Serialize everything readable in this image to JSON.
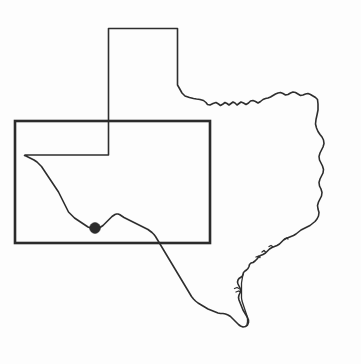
{
  "figure": {
    "type": "reference-map",
    "width": 361,
    "height": 364,
    "background_color": "#fdfdfd",
    "visible_text": []
  },
  "layers": {
    "state_outline": {
      "name": "texas-state-outline",
      "stroke_color": "#2e2e2e",
      "stroke_width": 1.6,
      "fill": "none"
    },
    "coast_inner": {
      "name": "gulf-coast-barrier-island-line",
      "stroke_color": "#2e2e2e",
      "stroke_width": 1.3,
      "fill": "none"
    },
    "study_area_box": {
      "name": "study-area-rectangle",
      "stroke_color": "#2b2b2b",
      "stroke_width": 2.6,
      "fill": "none",
      "x": 15,
      "y": 121,
      "width": 195,
      "height": 122
    },
    "site_marker": {
      "name": "site-location-dot",
      "fill_color": "#2b2b2b",
      "cx": 95,
      "cy": 228,
      "r": 5.4
    }
  },
  "geometry": {
    "state_path": "M108.5,28.5 L177.5,28.5 L177.5,85 L179.5,88.5 L182,93 L185,96 L189.5,97.5 L193.5,98.5 L196.5,99 L200,99.5 L203.5,100.5 L206,102.5 L207.5,104.5 L210,105 L213,103.5 L216,102.5 L218.5,104 L220.5,105.5 L223,104 L225,102.5 L227,103.5 L229,105 L231,103.5 L233,102 L235,103 L237,105 L239,103.5 L241,102 L243.5,103 L246,104.5 L248.5,103 L250.5,101 L253,100.5 L255.5,101.5 L258,103 L260.5,101.5 L263,99.5 L265.5,98.5 L268,98 L270.5,97 L273,95.5 L275.5,94 L278,93 L280.5,92.5 L283,93.5 L285.5,95 L288,94.5 L290.5,93 L293,92 L295.5,92.5 L298,94 L300.5,95.5 L303,95 L305.5,94 L308,93.5 L310.5,94.5 L313,96 L315.5,97.5 L317.5,99.5 L318,104 L318,110 L317,115 L316,119.5 L315.5,124 L316.5,128 L318,131.5 L320,134.5 L322,137 L323.5,140 L324,143.5 L323,147 L321.5,150 L320,153 L319,156.5 L319.5,160 L321,163 L322.5,166 L323.5,169.5 L323,173 L321.5,176 L320,179 L319,182.5 L319.5,186 L321,189 L322,192.5 L321.5,196 L320,199 L318.5,202 L317.5,205.5 L318,209 L319,212.5 L318.5,216 L317,219 L315,221.5 L312.5,223.5 L310,225.5 L307,227 L304,228.5 L301,230 L298.5,232 L296,234 L293.5,235.5 L291,236.5 L288.5,237.5 L286,238.5 L283.5,240 L281.5,242 L279.5,244 L277,245.5 L274.5,246.5 L272,247.5 L269.5,249 L267.5,251 L265.5,253 L263,254.5 L260.5,255.5 L258.5,257 L257,259 L255,261 L253,262.5 L251,263 L249.5,264.5 L249,266.5 L248,268.5 L246.5,270 L245,271 L243.5,272.5 L243,274.5 L242,276.5 L240.5,277.5 L239,278.5 L238,280 L237.5,282 L238,284 L239,286 L240,288 L240.5,290.5 L240,293 L239,295 L238.5,297.5 L239,300 L240,302.5 L241,305 L242,307.5 L243,310 L244.5,312.5 L246,315 L247.5,317.5 L248.5,320 L248.5,322.5 L247.5,325 L245.5,326.5 L243,327 L240.5,326 L238.5,324.5 L236.5,322.5 L234.5,320.5 L232.5,318.5 L230.5,316.5 L228,315 L225.5,314 L223,313.5 L220.5,313.5 L218,313 L215.5,312 L213,311 L210.5,310 L208,309 L205.5,307.5 L203,306 L200.5,304.5 L198,303 L195.5,301 L193.5,299 L191.5,296.5 L190,294 L188.5,291.5 L187,289 L185.5,286.5 L184,284 L182.5,281.5 L181,279 L179.5,276.5 L178,274 L176.5,271.5 L175,269 L173.5,266.5 L172,264 L170.5,261.5 L169,259 L167.5,256.5 L166,254 L164.5,251.5 L163,249 L161.5,246.5 L160,244 L158.5,241.5 L157,239 L155.5,236.5 L154,234.5 L152,232.5 L150,231 L148,229.5 L146,228.5 L144,227.5 L142,226.5 L140,225.5 L138,224.5 L136,223.5 L134,222.5 L132,221.5 L130,220.5 L128,219.5 L126,218.5 L124,217.5 L122.5,216.5 L121,215.5 L119.5,214.5 L118,214 L116.5,214 L115,214.5 L113.5,215.5 L112,216.5 L110.5,218 L109,219.5 L107.5,221 L106,222.5 L104.5,224 L103,225.5 L101.5,226.5 L100,227.5 L98.5,228 L97,228.5 L95.5,228.5 L94,228.5 L92.5,228.5 L91,228 L89.5,227.5 L88,227 L86.5,226 L85,225 L83.5,224 L82,223 L80.5,222 L79,221 L77.5,220 L76,219 L74.5,218 L73,216.5 L71.5,215 L70,213.5 L68.5,212 L67.5,210 L66.5,208 L65.5,206 L64.5,204 L63.5,202 L62.5,200 L61.5,198 L60.5,196 L59.5,194 L58.5,192 L57.5,190.5 L56.5,189 L55.5,187.5 L54.5,186 L53.5,184.5 L52.5,183 L51.5,181.5 L50.5,180 L49.5,178.5 L48.5,177 L47.5,175.5 L46.5,174 L45.5,172.5 L44.5,171 L43.5,169.5 L42.5,168 L41.5,166.5 L40,165 L38.5,163.5 L37,162 L35.5,161 L34,160 L32,159 L30,158 L28,157 L26,156 L24.5,155.5 L25,155 L108.5,155 Z",
    "coast_inner_path": "M243,274.5 L242.5,277 L242,280 L241.5,283 L241.5,286 L241.5,289 L241.5,292 L241.5,295 L241.5,298 L242,301 L243,304 L244,307 L245,310 L246,313 L247,316 L247.5,319 L247.5,322 L247,324.5",
    "coast_spur_paths": [
      "M234.5,288.5 L237,287.5 L239,288.5",
      "M236,292 L238.5,291 L240.5,292",
      "M256,257 L258.5,256 L260,257.5",
      "M262,252 L264,250.5 L265.5,252",
      "M269,246.5 L271,245.5 L272.5,246.5",
      "M284.5,239 L286.5,238 L288,239"
    ]
  },
  "colors": {
    "line": "#2e2e2e",
    "box": "#2b2b2b",
    "marker": "#2b2b2b",
    "background": "#fdfdfd"
  }
}
